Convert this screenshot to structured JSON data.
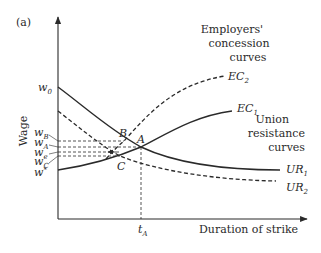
{
  "panel_label": "(a)",
  "axes": {
    "y_label": "Wage",
    "x_label": "Duration of strike"
  },
  "group_labels": {
    "employers": [
      "Employers'",
      "concession",
      "curves"
    ],
    "union": [
      "Union",
      "resistance",
      "curves"
    ]
  },
  "curves": {
    "EC2": {
      "base": "EC",
      "sub": "2",
      "style": "dashed"
    },
    "EC1": {
      "base": "EC",
      "sub": "1",
      "style": "solid"
    },
    "UR1": {
      "base": "UR",
      "sub": "1",
      "style": "solid"
    },
    "UR2": {
      "base": "UR",
      "sub": "2",
      "style": "dashed"
    }
  },
  "y_ticks": {
    "w0": {
      "base": "w",
      "sub": "0"
    },
    "wB": {
      "base": "w",
      "sub": "B"
    },
    "wA": {
      "base": "w",
      "sub": "A"
    },
    "we": {
      "base": "w",
      "sub": "e"
    },
    "wC": {
      "base": "w",
      "sub": "C"
    },
    "wstar": {
      "base": "w",
      "sup": "*"
    }
  },
  "points": {
    "A": "A",
    "B": "B",
    "C": "C"
  },
  "x_ticks": {
    "tA": {
      "base": "t",
      "sub": "A"
    }
  },
  "colors": {
    "ink": "#2a2a2a",
    "background": "#ffffff"
  }
}
